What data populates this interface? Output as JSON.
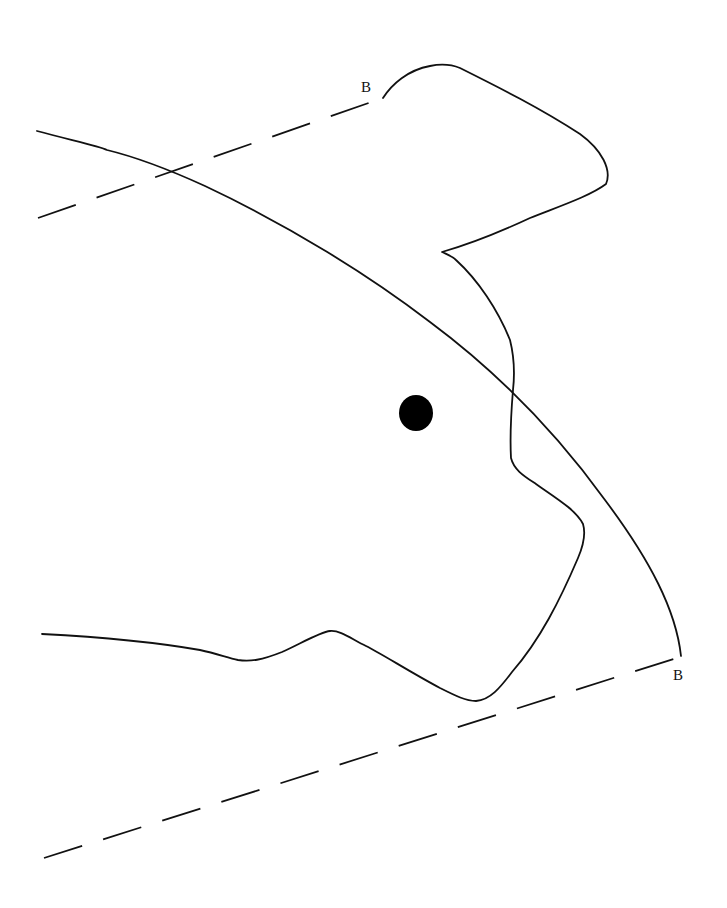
{
  "diagram": {
    "labels": {
      "section_top": "B",
      "section_bottom": "B"
    },
    "elements": [
      {
        "type": "outline",
        "name": "specimen-outline"
      },
      {
        "type": "arc",
        "name": "curved-boundary-line"
      },
      {
        "type": "dashed-line",
        "name": "section-line-top"
      },
      {
        "type": "dashed-line",
        "name": "section-line-bottom"
      },
      {
        "type": "dot",
        "name": "reference-point"
      }
    ],
    "colors": {
      "ink": "#111111",
      "background": "#ffffff"
    }
  }
}
